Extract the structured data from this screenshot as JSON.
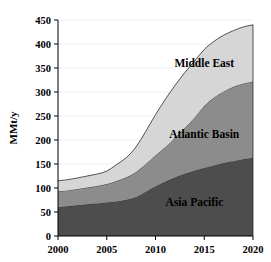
{
  "chart_data": {
    "type": "area",
    "title": "",
    "subtitle": "",
    "xlabel": "",
    "ylabel": "MMt/y",
    "stacked": true,
    "grid": true,
    "legend_position": "inline-labels",
    "xlim": [
      2000,
      2020
    ],
    "ylim": [
      0,
      450
    ],
    "x": [
      2000,
      2001,
      2002,
      2003,
      2004,
      2005,
      2006,
      2007,
      2008,
      2009,
      2010,
      2011,
      2012,
      2013,
      2014,
      2015,
      2016,
      2017,
      2018,
      2019,
      2020
    ],
    "x_tick_labels": [
      "2000",
      "2005",
      "2010",
      "2015",
      "2020"
    ],
    "x_ticks": [
      2000,
      2005,
      2010,
      2015,
      2020
    ],
    "y_ticks": [
      0,
      50,
      100,
      150,
      200,
      250,
      300,
      350,
      400,
      450
    ],
    "y_tick_labels": [
      "0",
      "50",
      "100",
      "150",
      "200",
      "250",
      "300",
      "350",
      "400",
      "450"
    ],
    "series": [
      {
        "name": "Asia Pacific",
        "color": "#4d4d4d",
        "label_x": 2014,
        "label_y": 62,
        "values": [
          60,
          62,
          64,
          66,
          68,
          70,
          72,
          75,
          80,
          92,
          104,
          113,
          122,
          130,
          136,
          142,
          147,
          152,
          156,
          160,
          163
        ]
      },
      {
        "name": "Atlantic Basin",
        "color": "#8c8c8c",
        "label_x": 2015,
        "label_y": 205,
        "values": [
          33,
          33,
          34,
          35,
          36,
          38,
          42,
          47,
          52,
          58,
          64,
          72,
          82,
          95,
          110,
          130,
          142,
          150,
          155,
          158,
          159
        ]
      },
      {
        "name": "Middle East",
        "color": "#d6d6d6",
        "label_x": 2015,
        "label_y": 352,
        "values": [
          22,
          22,
          23,
          24,
          25,
          26,
          35,
          40,
          52,
          68,
          85,
          100,
          110,
          116,
          118,
          118,
          117,
          117,
          117,
          118,
          118
        ]
      }
    ],
    "cumulative_tops": {
      "asia_pacific": [
        60,
        62,
        64,
        66,
        68,
        70,
        72,
        75,
        80,
        92,
        104,
        113,
        122,
        130,
        136,
        142,
        147,
        152,
        156,
        160,
        163
      ],
      "atlantic_basin": [
        93,
        95,
        98,
        101,
        104,
        108,
        114,
        122,
        132,
        150,
        168,
        185,
        204,
        225,
        246,
        272,
        289,
        302,
        311,
        318,
        322
      ],
      "middle_east": [
        115,
        117,
        121,
        125,
        129,
        134,
        149,
        162,
        184,
        218,
        253,
        285,
        314,
        341,
        364,
        390,
        406,
        419,
        428,
        436,
        440
      ]
    }
  },
  "axes": {
    "y_axis_title": "MMt/y"
  }
}
